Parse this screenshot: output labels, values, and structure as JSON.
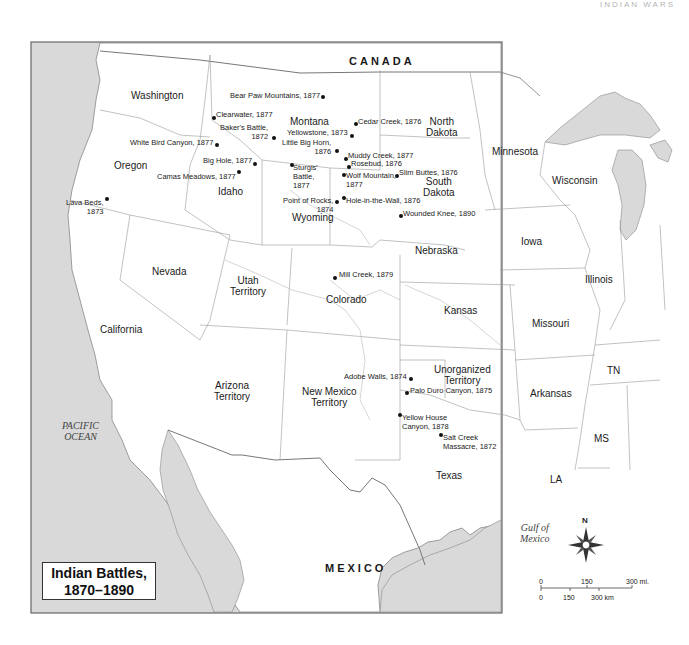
{
  "page_header": "INDIAN WARS",
  "map": {
    "title_line1": "Indian Battles,",
    "title_line2": "1870–1890",
    "countries": {
      "canada": "CANADA",
      "mexico": "MEXICO"
    },
    "water": {
      "pacific_line1": "PACIFIC",
      "pacific_line2": "OCEAN",
      "gulf_line1": "Gulf of",
      "gulf_line2": "Mexico"
    },
    "states": {
      "washington": "Washington",
      "oregon": "Oregon",
      "idaho": "Idaho",
      "montana": "Montana",
      "wyoming": "Wyoming",
      "north_dakota_1": "North",
      "north_dakota_2": "Dakota",
      "south_dakota_1": "South",
      "south_dakota_2": "Dakota",
      "minnesota": "Minnesota",
      "wisconsin": "Wisconsin",
      "iowa": "Iowa",
      "illinois": "Illinois",
      "nebraska": "Nebraska",
      "kansas": "Kansas",
      "missouri": "Missouri",
      "nevada": "Nevada",
      "utah_1": "Utah",
      "utah_2": "Territory",
      "colorado": "Colorado",
      "california": "California",
      "arizona_1": "Arizona",
      "arizona_2": "Territory",
      "new_mexico_1": "New Mexico",
      "new_mexico_2": "Territory",
      "unorganized_1": "Unorganized",
      "unorganized_2": "Territory",
      "arkansas": "Arkansas",
      "tn": "TN",
      "ms": "MS",
      "la": "LA",
      "texas": "Texas"
    },
    "battles": [
      {
        "name": "Bear Paw Mountains, 1877"
      },
      {
        "name": "Clearwater, 1877"
      },
      {
        "name": "Baker's Battle,",
        "name2": "1872"
      },
      {
        "name": "White Bird Canyon, 1877"
      },
      {
        "name": "Big Hole, 1877"
      },
      {
        "name": "Camas Meadows, 1877"
      },
      {
        "name": "Cedar Creek, 1876"
      },
      {
        "name": "Yellowstone, 1873"
      },
      {
        "name": "Little Big Horn,",
        "name2": "1876"
      },
      {
        "name": "Muddy Creek, 1877"
      },
      {
        "name": "Rosebud, 1876"
      },
      {
        "name": "Sturgis'",
        "name2": "Battle,",
        "name3": "1877"
      },
      {
        "name": "Wolf Mountain,",
        "name2": "1877"
      },
      {
        "name": "Slim Buttes, 1876"
      },
      {
        "name": "Point of Rocks,",
        "name2": "1874"
      },
      {
        "name": "Hole-in-the-Wall, 1876"
      },
      {
        "name": "Wounded Knee, 1890"
      },
      {
        "name": "Lava Beds,",
        "name2": "1873"
      },
      {
        "name": "Mill Creek, 1879"
      },
      {
        "name": "Adobe Walls, 1874"
      },
      {
        "name": "Palo Duro Canyon, 1875"
      },
      {
        "name": "Yellow House",
        "name2": "Canyon, 1878"
      },
      {
        "name": "Salt Creek",
        "name2": "Massacre, 1872"
      }
    ],
    "compass": {
      "north": "N"
    },
    "scale": {
      "mi_0": "0",
      "mi_150": "150",
      "mi_300": "300 mi.",
      "km_0": "0",
      "km_150": "150",
      "km_300": "300 km"
    },
    "colors": {
      "water": "#d9d9d9",
      "land": "#ffffff",
      "border": "#808080",
      "frame": "#666666",
      "text": "#1a1a1a"
    }
  }
}
